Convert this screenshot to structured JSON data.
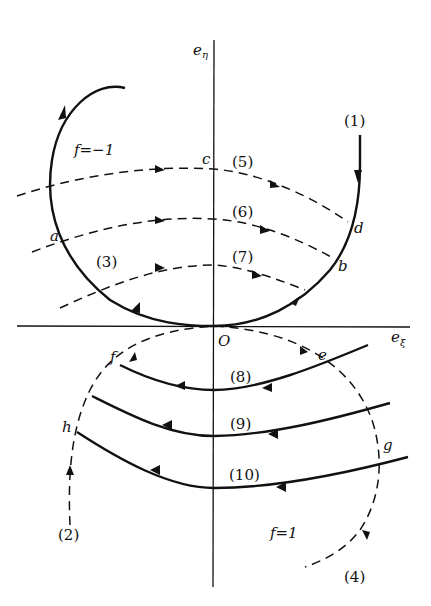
{
  "figure": {
    "axes": {
      "vertical_label": "eη",
      "horizontal_label": "eξ",
      "origin_label": "O"
    },
    "regions": [
      {
        "label": "f=−1",
        "position": "upper-left"
      },
      {
        "label": "f=1",
        "position": "lower-right"
      }
    ],
    "points": [
      "a",
      "b",
      "c",
      "d",
      "e",
      "f",
      "g",
      "h"
    ],
    "trajectories": [
      {
        "id": "(1)",
        "style": "solid"
      },
      {
        "id": "(2)",
        "style": "dashed"
      },
      {
        "id": "(3)",
        "style": "solid"
      },
      {
        "id": "(4)",
        "style": "dashed"
      },
      {
        "id": "(5)",
        "style": "dashed"
      },
      {
        "id": "(6)",
        "style": "dashed"
      },
      {
        "id": "(7)",
        "style": "dashed"
      },
      {
        "id": "(8)",
        "style": "solid"
      },
      {
        "id": "(9)",
        "style": "solid"
      },
      {
        "id": "(10)",
        "style": "solid"
      }
    ]
  },
  "labels": {
    "e_eta_base": "e",
    "e_eta_sub": "η",
    "e_xi_base": "e",
    "e_xi_sub": "ξ",
    "O": "O",
    "f_neg": "f=−1",
    "f_pos": "f=1",
    "a": "a",
    "b": "b",
    "c": "c",
    "d": "d",
    "e": "e",
    "f": "f",
    "g": "g",
    "h": "h",
    "t1": "(1)",
    "t2": "(2)",
    "t3": "(3)",
    "t4": "(4)",
    "t5": "(5)",
    "t6": "(6)",
    "t7": "(7)",
    "t8": "(8)",
    "t9": "(9)",
    "t10": "(10)"
  }
}
